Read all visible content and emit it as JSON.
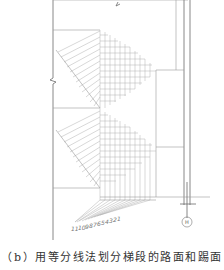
{
  "figure": {
    "caption": "（b）用等分线法划分梯段的路面和踢面",
    "axis_label": "H",
    "division_labels": [
      "11",
      "10",
      "9",
      "8",
      "7",
      "6",
      "5",
      "4",
      "3",
      "2",
      "1"
    ],
    "upper_flight_labels": [
      "1",
      "2",
      "3",
      "4",
      "5",
      "6",
      "7",
      "8",
      "9",
      "10",
      "11"
    ],
    "lower_flight_labels": [
      "1",
      "2",
      "3",
      "4",
      "5",
      "6",
      "7",
      "8",
      "9",
      "10",
      "11"
    ]
  },
  "colors": {
    "line": "#9a9a9a",
    "line_dark": "#6a6a6a",
    "text": "#333333"
  }
}
